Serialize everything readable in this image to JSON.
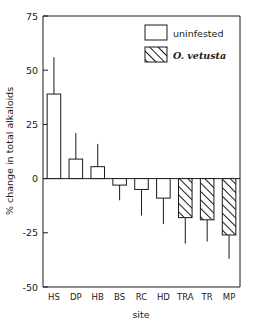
{
  "chart_data": {
    "type": "bar",
    "title": "",
    "xlabel": "site",
    "ylabel": "% change in total alkaloids",
    "categories": [
      "HS",
      "DP",
      "HB",
      "BS",
      "RC",
      "HD",
      "TRA",
      "TR",
      "MP"
    ],
    "values": [
      39,
      9,
      5.5,
      -3,
      -5,
      -9,
      -18,
      -19,
      -26
    ],
    "error_upper": [
      56,
      21,
      16,
      -3,
      -5,
      -9,
      -18,
      -19,
      -26
    ],
    "error_lower": [
      39,
      9,
      5.5,
      -10,
      -17,
      -21,
      -30,
      -29,
      -37
    ],
    "group_of_bar": [
      "uninfested",
      "uninfested",
      "uninfested",
      "uninfested",
      "uninfested",
      "uninfested",
      "O. vetusta",
      "O. vetusta",
      "O. vetusta"
    ],
    "ylim": [
      -50,
      75
    ],
    "yticks": [
      75,
      50,
      25,
      0,
      -25,
      -50
    ],
    "ytick_labels": [
      "75",
      "50",
      "25",
      "0",
      "-25",
      "-50"
    ],
    "grid": false,
    "legend_position": "top-right",
    "legend": [
      {
        "label": "uninfested",
        "style": "open",
        "italic": false
      },
      {
        "label": "O. vetusta",
        "style": "hatched",
        "italic": true
      }
    ],
    "colors": {
      "bar_fill": "#ffffff",
      "bar_stroke": "#1a1a1a",
      "hatch_stroke": "#1a1a1a",
      "axis": "#1a1a1a",
      "background": "#ffffff"
    }
  }
}
